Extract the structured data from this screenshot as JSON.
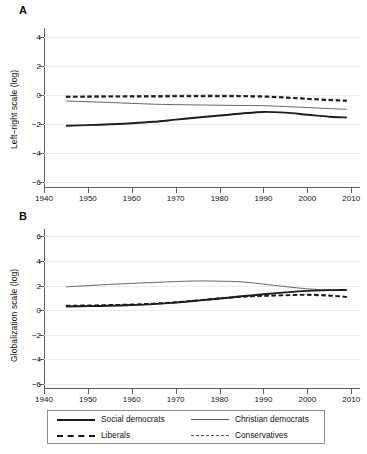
{
  "figure": {
    "background": "#ffffff",
    "panels": [
      {
        "id": "A",
        "label": "A"
      },
      {
        "id": "B",
        "label": "B"
      }
    ]
  },
  "legend": {
    "items": [
      {
        "label": "Social democrats",
        "style": "thick-solid",
        "color": "#1c1c1c"
      },
      {
        "label": "Christian democrats",
        "style": "thin-solid",
        "color": "#555555"
      },
      {
        "label": "Liberals",
        "style": "thick-dash",
        "color": "#1c1c1c"
      },
      {
        "label": "Conservatives",
        "style": "thin-dash",
        "color": "#555555"
      }
    ]
  },
  "chart_data": [
    {
      "type": "line",
      "panel": "A",
      "title": "A",
      "xlabel": "",
      "ylabel": "Left–right scale (log)",
      "xlim": [
        1940,
        2012
      ],
      "ylim": [
        -6.4,
        4.6
      ],
      "xticks": [
        1940,
        1950,
        1960,
        1970,
        1980,
        1990,
        2000,
        2010
      ],
      "yticks": [
        4,
        2,
        0,
        -2,
        -4,
        -6
      ],
      "grid": "horizontal",
      "legend_position": "below-figure",
      "x": [
        1945,
        1950,
        1955,
        1960,
        1965,
        1970,
        1975,
        1980,
        1985,
        1990,
        1995,
        2000,
        2005,
        2009
      ],
      "series": [
        {
          "name": "Social democrats",
          "style": "thick-solid",
          "color": "#1c1c1c",
          "values": [
            -2.12,
            -2.08,
            -2.02,
            -1.95,
            -1.85,
            -1.7,
            -1.55,
            -1.42,
            -1.28,
            -1.17,
            -1.22,
            -1.36,
            -1.5,
            -1.55
          ]
        },
        {
          "name": "Christian democrats",
          "style": "thin-solid",
          "color": "#555555",
          "values": [
            -0.42,
            -0.47,
            -0.52,
            -0.58,
            -0.64,
            -0.67,
            -0.69,
            -0.71,
            -0.73,
            -0.74,
            -0.8,
            -0.87,
            -0.94,
            -0.99
          ]
        },
        {
          "name": "Liberals",
          "style": "thick-dash",
          "color": "#1c1c1c",
          "values": [
            -0.14,
            -0.13,
            -0.12,
            -0.12,
            -0.11,
            -0.1,
            -0.09,
            -0.09,
            -0.1,
            -0.12,
            -0.19,
            -0.28,
            -0.36,
            -0.41
          ]
        },
        {
          "name": "Conservatives",
          "style": "thin-dash",
          "color": "#555555",
          "values": [
            -0.08,
            -0.07,
            -0.06,
            -0.05,
            -0.04,
            -0.03,
            -0.02,
            -0.02,
            -0.04,
            -0.07,
            -0.14,
            -0.23,
            -0.31,
            -0.36
          ]
        }
      ]
    },
    {
      "type": "line",
      "panel": "B",
      "title": "B",
      "xlabel": "",
      "ylabel": "Globalization scale (log)",
      "xlim": [
        1940,
        2012
      ],
      "ylim": [
        -6.4,
        6.6
      ],
      "xticks": [
        1940,
        1950,
        1960,
        1970,
        1980,
        1990,
        2000,
        2010
      ],
      "yticks": [
        6,
        4,
        2,
        0,
        -2,
        -4,
        -6
      ],
      "grid": "horizontal",
      "legend_position": "below-figure",
      "x": [
        1945,
        1950,
        1955,
        1960,
        1965,
        1970,
        1975,
        1980,
        1985,
        1990,
        1995,
        2000,
        2005,
        2009
      ],
      "series": [
        {
          "name": "Social democrats",
          "style": "thick-solid",
          "color": "#1c1c1c",
          "values": [
            0.3,
            0.33,
            0.37,
            0.42,
            0.5,
            0.62,
            0.78,
            0.95,
            1.13,
            1.3,
            1.45,
            1.57,
            1.63,
            1.65
          ]
        },
        {
          "name": "Christian democrats",
          "style": "thin-solid",
          "color": "#555555",
          "values": [
            1.9,
            2.0,
            2.1,
            2.18,
            2.26,
            2.33,
            2.38,
            2.36,
            2.31,
            2.12,
            1.92,
            1.74,
            1.64,
            1.6
          ]
        },
        {
          "name": "Liberals",
          "style": "thick-dash",
          "color": "#1c1c1c",
          "values": [
            0.36,
            0.39,
            0.42,
            0.46,
            0.54,
            0.65,
            0.8,
            0.96,
            1.1,
            1.18,
            1.22,
            1.25,
            1.18,
            1.08
          ]
        },
        {
          "name": "Conservatives",
          "style": "thin-dash",
          "color": "#555555",
          "values": [
            0.33,
            0.36,
            0.4,
            0.45,
            0.53,
            0.64,
            0.79,
            0.95,
            1.07,
            1.14,
            1.2,
            1.3,
            1.22,
            1.1
          ]
        }
      ]
    }
  ]
}
